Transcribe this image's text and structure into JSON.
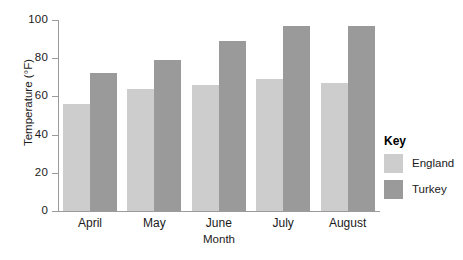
{
  "chart_data": {
    "type": "bar",
    "title": "",
    "xlabel": "Month",
    "ylabel": "Temperature (°F)",
    "categories": [
      "April",
      "May",
      "June",
      "July",
      "August"
    ],
    "series": [
      {
        "name": "England",
        "color": "#cdcdcd",
        "values": [
          56,
          64,
          66,
          69,
          67
        ]
      },
      {
        "name": "Turkey",
        "color": "#9a9a9a",
        "values": [
          72,
          79,
          89,
          97,
          97
        ]
      }
    ],
    "ylim": [
      0,
      100
    ],
    "yticks": [
      0,
      20,
      40,
      60,
      80,
      100
    ],
    "ytick_labels": [
      "0",
      "20",
      "40",
      "60",
      "80",
      "100"
    ],
    "grid": false,
    "legend_position": "right"
  },
  "legend": {
    "title": "Key",
    "entries": [
      {
        "label": "England",
        "color": "#cdcdcd"
      },
      {
        "label": "Turkey",
        "color": "#9a9a9a"
      }
    ]
  },
  "axes": {
    "x_title": "Month",
    "y_title": "Temperature (°F)"
  }
}
